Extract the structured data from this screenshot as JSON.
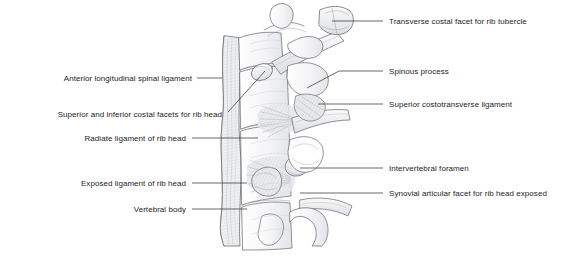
{
  "figure": {
    "name": "thoracic-vertebrae-rib-articulation-illustration",
    "ink_color": "#6b6e73",
    "shade_color": "#d9dade",
    "background": "#ffffff"
  },
  "labels": {
    "left": [
      {
        "id": "anterior-longitudinal-spinal-ligament",
        "text": "Anterior longitudinal spinal ligament",
        "text_right": 192,
        "text_top": 74,
        "leader": {
          "x1": 197,
          "y1": 78,
          "x2": 222,
          "y2": 78
        }
      },
      {
        "id": "superior-and-inferior-costal-facets-for-rib-head",
        "text": "Superior and inferior costal facets for rib head",
        "text_right": 222,
        "text_top": 110,
        "leader": {
          "x1": 228,
          "y1": 112,
          "x2": 265,
          "y2": 71
        }
      },
      {
        "id": "radiate-ligament-of-rib-head",
        "text": "Radiate ligament of rib head",
        "text_right": 186,
        "text_top": 134,
        "leader": {
          "x1": 192,
          "y1": 138,
          "x2": 258,
          "y2": 138
        }
      },
      {
        "id": "exposed-ligament-of-rib-head",
        "text": "Exposed ligament of rib head",
        "text_right": 186,
        "text_top": 179,
        "leader": {
          "x1": 192,
          "y1": 183,
          "x2": 247,
          "y2": 183
        }
      },
      {
        "id": "vertebral-body",
        "text": "Vertebral body",
        "text_right": 186,
        "text_top": 205,
        "leader": {
          "x1": 192,
          "y1": 209,
          "x2": 247,
          "y2": 209
        }
      }
    ],
    "right": [
      {
        "id": "transverse-costal-facet-for-rib-tubercle",
        "text": "Transverse costal facet for rib tubercle",
        "text_left": 389,
        "text_top": 17,
        "leader": {
          "x1": 383,
          "y1": 21,
          "x2": 332,
          "y2": 21
        }
      },
      {
        "id": "spinous-process",
        "text": "Spinous process",
        "text_left": 389,
        "text_top": 67,
        "leader": {
          "x1": 383,
          "y1": 71,
          "x2": 339,
          "y2": 71,
          "x3": 307,
          "y3": 88
        }
      },
      {
        "id": "superior-costotransverse-ligament",
        "text": "Superior costotransverse ligament",
        "text_left": 389,
        "text_top": 100,
        "leader": {
          "x1": 383,
          "y1": 104,
          "x2": 318,
          "y2": 104
        }
      },
      {
        "id": "intervertebral-foramen",
        "text": "Intervertebral foramen",
        "text_left": 389,
        "text_top": 164,
        "leader": {
          "x1": 383,
          "y1": 168,
          "x2": 300,
          "y2": 168
        }
      },
      {
        "id": "synovial-articular-facet-for-rib-head-exposed",
        "text": "Synovial articular facet for rib head exposed",
        "text_left": 389,
        "text_top": 189,
        "leader": {
          "x1": 383,
          "y1": 193,
          "x2": 300,
          "y2": 193
        }
      }
    ]
  }
}
